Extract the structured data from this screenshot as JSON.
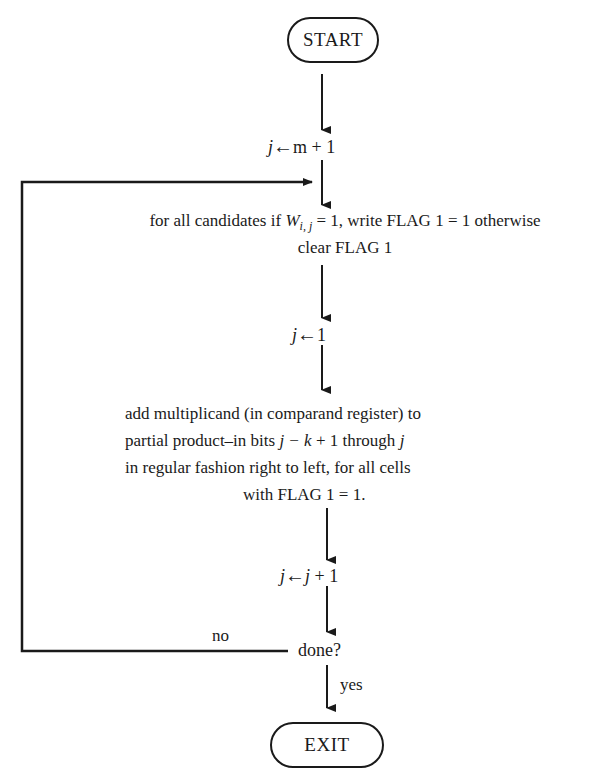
{
  "flowchart": {
    "start": {
      "label": "START"
    },
    "init": {
      "var": "j",
      "arrow": "←",
      "expr": "m + 1"
    },
    "step1": {
      "line1_prefix": "for all candidates if ",
      "line1_W": "W",
      "line1_sub": "i, j",
      "line1_suffix": " = 1, write FLAG 1 = 1 otherwise",
      "line2": "clear FLAG 1"
    },
    "reset": {
      "var": "j",
      "arrow": "←",
      "expr": "1"
    },
    "step2": {
      "line1": "add multiplicand (in comparand register) to",
      "line2_prefix": "partial product–in bits ",
      "line2_math": "j − k",
      "line2_mid": " + 1 through ",
      "line2_end": "j",
      "line3": "in regular fashion right to left, for all cells",
      "line4": "with FLAG 1 = 1."
    },
    "increment": {
      "var": "j",
      "arrow": "←",
      "expr_var": "j",
      "expr_rest": " + 1"
    },
    "decision": {
      "label": "done?",
      "no_label": "no",
      "yes_label": "yes"
    },
    "exit": {
      "label": "EXIT"
    },
    "colors": {
      "ink": "#1a1a1a",
      "background": "#ffffff"
    }
  }
}
